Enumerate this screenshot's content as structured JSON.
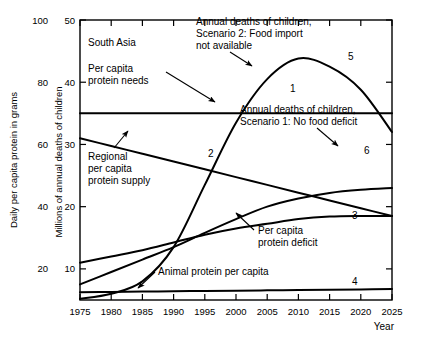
{
  "figure": {
    "region_label": "South Asia",
    "xlabel": "Year",
    "ylabel_left": "Daily per capita protein in grams",
    "ylabel_right": "Millions of annual deaths of children"
  },
  "axes": {
    "x_ticks": [
      "1975",
      "1980",
      "1985",
      "1990",
      "1995",
      "2000",
      "2005",
      "2010",
      "2015",
      "2020",
      "2025"
    ],
    "x_min": 1975,
    "x_max": 2025,
    "y_left_ticks": [
      "20",
      "40",
      "60",
      "80",
      "100"
    ],
    "y_left_min": 10,
    "y_left_max": 100,
    "y_right_ticks": [
      "10",
      "20",
      "30",
      "40",
      "50"
    ],
    "y_right_min": 5,
    "y_right_max": 50
  },
  "annotations": [
    {
      "name": "per-capita-protein-needs",
      "text_lines": [
        "Per capita",
        "protein needs"
      ],
      "x": 88,
      "y": 72
    },
    {
      "name": "regional-per-capita-protein-supply",
      "text_lines": [
        "Regional",
        "per capita",
        "protein supply"
      ],
      "x": 88,
      "y": 160
    },
    {
      "name": "annual-deaths-scenario-2",
      "text_lines": [
        "Annual deaths of children,",
        "Scenario 2: Food import",
        "not available"
      ],
      "x": 196,
      "y": 25
    },
    {
      "name": "annual-deaths-scenario-1",
      "text_lines": [
        "Annual deaths of children,",
        "Scenario 1: No food deficit"
      ],
      "x": 240,
      "y": 113
    },
    {
      "name": "per-capita-protein-deficit",
      "text_lines": [
        "Per capita",
        "protein deficit"
      ],
      "x": 258,
      "y": 234
    },
    {
      "name": "animal-protein-per-capita",
      "text_lines": [
        "Animal protein per capita"
      ],
      "x": 158,
      "y": 275
    }
  ],
  "curve_numbers": [
    {
      "id": "1",
      "x": 290,
      "y": 92
    },
    {
      "id": "2",
      "x": 208,
      "y": 157
    },
    {
      "id": "3",
      "x": 352,
      "y": 219
    },
    {
      "id": "4",
      "x": 352,
      "y": 285
    },
    {
      "id": "5",
      "x": 348,
      "y": 60
    },
    {
      "id": "6",
      "x": 364,
      "y": 154
    }
  ],
  "chart_data": {
    "type": "line",
    "title": "South Asia",
    "xlabel": "Year",
    "ylabel": "Daily per capita protein in grams",
    "ylabel_secondary": "Millions of annual deaths of children",
    "xlim": [
      1975,
      2025
    ],
    "ylim_left": [
      10,
      100
    ],
    "ylim_right": [
      5,
      50
    ],
    "grid": false,
    "legend": "inline-annotations",
    "x": [
      1975,
      1980,
      1985,
      1990,
      1995,
      2000,
      2005,
      2010,
      2015,
      2020,
      2025
    ],
    "series": [
      {
        "name": "Per capita protein needs",
        "number": "1",
        "axis": "left",
        "values": [
          70,
          70,
          70,
          70,
          70,
          70,
          70,
          70,
          70,
          70,
          70
        ]
      },
      {
        "name": "Regional per capita protein supply",
        "number": "2",
        "axis": "left",
        "values": [
          62,
          59.5,
          57,
          54.5,
          52,
          49.5,
          47,
          44.5,
          42,
          39.5,
          37
        ]
      },
      {
        "name": "Per capita protein deficit",
        "number": "3",
        "axis": "left",
        "values": [
          22,
          24,
          26,
          28.5,
          31,
          33,
          34.5,
          36,
          36.8,
          37,
          37
        ]
      },
      {
        "name": "Animal protein per capita",
        "number": "4",
        "axis": "left",
        "values": [
          12.5,
          12.6,
          12.7,
          12.8,
          12.9,
          13,
          13.1,
          13.2,
          13.3,
          13.4,
          13.5
        ]
      },
      {
        "name": "Annual deaths of children, Scenario 2: Food import not available",
        "number": "5",
        "axis": "right",
        "values": [
          5.2,
          6.0,
          8.0,
          13.5,
          23.5,
          33.5,
          40.5,
          43.8,
          42.5,
          38.8,
          32.0
        ]
      },
      {
        "name": "Annual deaths of children, Scenario 1: No food deficit",
        "number": "6",
        "axis": "right",
        "values": [
          7.5,
          9.5,
          11.5,
          13.5,
          15.8,
          18.0,
          20.0,
          21.3,
          22.2,
          22.7,
          23.0
        ]
      }
    ]
  }
}
